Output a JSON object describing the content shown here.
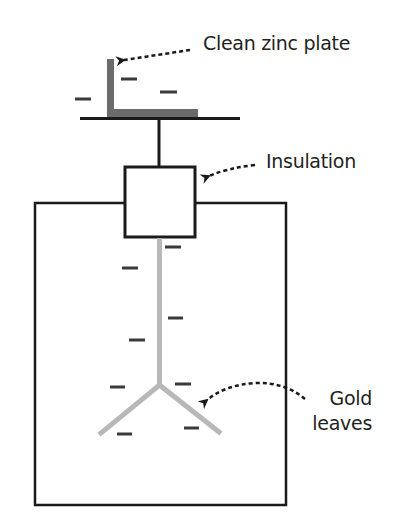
{
  "diagram": {
    "colors": {
      "outline": "#1a1a1a",
      "zinc": "#6b6b6b",
      "gold_leaf": "#b8b8b8",
      "charge": "#3a3a3a",
      "text": "#231f20"
    },
    "labels": {
      "zinc_plate": "Clean zinc plate",
      "insulation": "Insulation",
      "gold_line1": "Gold",
      "gold_line2": "leaves"
    },
    "charge_symbol": "−",
    "charges": [
      {
        "x1": 121,
        "x2": 137,
        "y": 79
      },
      {
        "x1": 75,
        "x2": 91,
        "y": 99
      },
      {
        "x1": 160,
        "x2": 177,
        "y": 92
      },
      {
        "x1": 165,
        "x2": 181,
        "y": 247
      },
      {
        "x1": 122,
        "x2": 138,
        "y": 268
      },
      {
        "x1": 168,
        "x2": 183,
        "y": 318
      },
      {
        "x1": 129,
        "x2": 145,
        "y": 340
      },
      {
        "x1": 110,
        "x2": 125,
        "y": 387
      },
      {
        "x1": 175,
        "x2": 191,
        "y": 384
      },
      {
        "x1": 117,
        "x2": 132,
        "y": 434
      },
      {
        "x1": 184,
        "x2": 199,
        "y": 428
      }
    ]
  }
}
